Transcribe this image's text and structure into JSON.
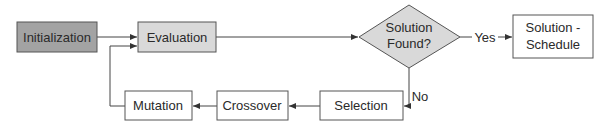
{
  "diagram": {
    "title": "",
    "colors": {
      "start_fill": "#a3a3a3",
      "process_fill": "#d9d9d9",
      "plain_fill": "#ffffff",
      "stroke": "#555555",
      "edge": "#444444",
      "text": "#2a2a2a"
    },
    "nodes": {
      "initialization": {
        "label": "Initialization",
        "shape": "rect"
      },
      "evaluation": {
        "label": "Evaluation",
        "shape": "rect"
      },
      "decision": {
        "label_line1": "Solution",
        "label_line2": "Found?",
        "shape": "diamond"
      },
      "solution": {
        "label_line1": "Solution -",
        "label_line2": "Schedule",
        "shape": "rect"
      },
      "selection": {
        "label": "Selection",
        "shape": "rect"
      },
      "crossover": {
        "label": "Crossover",
        "shape": "rect"
      },
      "mutation": {
        "label": "Mutation",
        "shape": "rect"
      }
    },
    "edges": [
      {
        "from": "initialization",
        "to": "evaluation",
        "label": ""
      },
      {
        "from": "evaluation",
        "to": "decision",
        "label": ""
      },
      {
        "from": "decision",
        "to": "solution",
        "label": "Yes"
      },
      {
        "from": "decision",
        "to": "selection",
        "label": "No"
      },
      {
        "from": "selection",
        "to": "crossover",
        "label": ""
      },
      {
        "from": "crossover",
        "to": "mutation",
        "label": ""
      },
      {
        "from": "mutation",
        "to": "evaluation",
        "label": ""
      }
    ],
    "edge_labels": {
      "yes": "Yes",
      "no": "No"
    }
  }
}
